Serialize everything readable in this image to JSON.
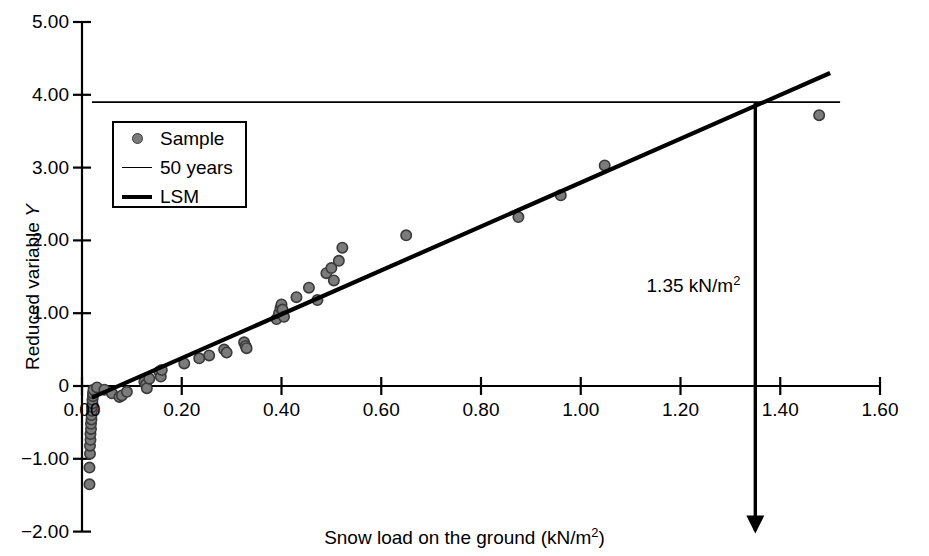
{
  "chart_data": {
    "type": "scatter",
    "title": "",
    "xlabel": "Snow load on the ground (kN/m2)",
    "ylabel": "Reduced variable Y",
    "xlim": [
      0.0,
      1.6
    ],
    "ylim": [
      -2.0,
      5.0
    ],
    "grid": false,
    "legend_position": "upper-left",
    "xticks": [
      "0.00",
      "0.20",
      "0.40",
      "0.60",
      "0.80",
      "1.00",
      "1.20",
      "1.40",
      "1.60"
    ],
    "xtick_values": [
      0.0,
      0.2,
      0.4,
      0.6,
      0.8,
      1.0,
      1.2,
      1.4,
      1.6
    ],
    "yticks": [
      "5.00",
      "4.00",
      "3.00",
      "2.00",
      "1.00",
      "0",
      "-1.00",
      "-2.00"
    ],
    "ytick_values": [
      5.0,
      4.0,
      3.0,
      2.0,
      1.0,
      0.0,
      -1.0,
      -2.0
    ],
    "series": [
      {
        "name": "Sample",
        "type": "scatter",
        "marker": "circle",
        "color": "#7b7b7b",
        "edge_color": "#3a3a3a",
        "points": [
          [
            0.015,
            -1.35
          ],
          [
            0.015,
            -1.12
          ],
          [
            0.016,
            -0.93
          ],
          [
            0.016,
            -0.82
          ],
          [
            0.017,
            -0.74
          ],
          [
            0.017,
            -0.66
          ],
          [
            0.018,
            -0.59
          ],
          [
            0.018,
            -0.52
          ],
          [
            0.019,
            -0.46
          ],
          [
            0.019,
            -0.4
          ],
          [
            0.02,
            -0.34
          ],
          [
            0.02,
            -0.29
          ],
          [
            0.021,
            -0.24
          ],
          [
            0.021,
            -0.19
          ],
          [
            0.022,
            -0.14
          ],
          [
            0.022,
            -0.1
          ],
          [
            0.023,
            -0.05
          ],
          [
            0.03,
            -0.02
          ],
          [
            0.045,
            -0.05
          ],
          [
            0.06,
            -0.1
          ],
          [
            0.075,
            -0.15
          ],
          [
            0.08,
            -0.13
          ],
          [
            0.09,
            -0.08
          ],
          [
            0.125,
            0.06
          ],
          [
            0.128,
            0.02
          ],
          [
            0.13,
            -0.03
          ],
          [
            0.135,
            0.1
          ],
          [
            0.155,
            0.2
          ],
          [
            0.158,
            0.13
          ],
          [
            0.16,
            0.22
          ],
          [
            0.205,
            0.31
          ],
          [
            0.235,
            0.38
          ],
          [
            0.255,
            0.42
          ],
          [
            0.285,
            0.5
          ],
          [
            0.29,
            0.46
          ],
          [
            0.325,
            0.6
          ],
          [
            0.328,
            0.55
          ],
          [
            0.33,
            0.52
          ],
          [
            0.39,
            0.92
          ],
          [
            0.395,
            1.0
          ],
          [
            0.398,
            1.07
          ],
          [
            0.4,
            1.12
          ],
          [
            0.402,
            1.05
          ],
          [
            0.405,
            0.95
          ],
          [
            0.43,
            1.22
          ],
          [
            0.455,
            1.35
          ],
          [
            0.472,
            1.18
          ],
          [
            0.49,
            1.55
          ],
          [
            0.5,
            1.62
          ],
          [
            0.505,
            1.45
          ],
          [
            0.515,
            1.72
          ],
          [
            0.522,
            1.9
          ],
          [
            0.65,
            2.07
          ],
          [
            0.875,
            2.32
          ],
          [
            0.96,
            2.62
          ],
          [
            1.048,
            3.03
          ],
          [
            1.478,
            3.72
          ]
        ]
      },
      {
        "name": "50 years",
        "type": "line",
        "style": "thin",
        "color": "#000000",
        "y_value": 3.9,
        "x_from": 0.02,
        "x_to": 1.52
      },
      {
        "name": "LSM",
        "type": "line",
        "style": "thick",
        "color": "#000000",
        "x_from": 0.02,
        "x_to": 1.5,
        "y_from": -0.16,
        "y_to": 4.3,
        "slope": 3.014,
        "intercept": -0.22
      }
    ],
    "annotations": [
      {
        "label_text": "1.35 kN/m",
        "label_sup": "2",
        "type": "arrow-down",
        "x": 1.35,
        "y_from": 3.9,
        "y_to": -2.0
      }
    ]
  },
  "axis": {
    "x_title_text": "Snow load on the ground (kN/m",
    "x_title_sup": "2",
    "x_title_tail": ")",
    "y_title_text": "Reduced variable ",
    "y_title_italic": "Y"
  },
  "legend": {
    "items": [
      {
        "label": "Sample",
        "key": "marker-dot"
      },
      {
        "label": "50 years",
        "key": "line-thin"
      },
      {
        "label": "LSM",
        "key": "line-thick"
      }
    ]
  }
}
